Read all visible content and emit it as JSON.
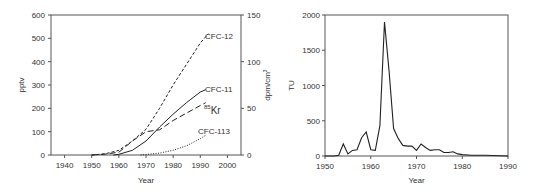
{
  "chart_data": [
    {
      "type": "line",
      "title": "",
      "xlabel": "Year",
      "ylabel": "pptv",
      "ylabel_right": "dpm/cm3",
      "xlim": [
        1935,
        2005
      ],
      "ylim": [
        0,
        600
      ],
      "ylim_right": [
        0,
        150
      ],
      "xticks": [
        "1940",
        "1950",
        "1960",
        "1970",
        "1980",
        "1990",
        "2000"
      ],
      "yticks": [
        "0",
        "100",
        "200",
        "300",
        "400",
        "500",
        "600"
      ],
      "yticks_right": [
        "0",
        "50",
        "100",
        "150"
      ],
      "grid": false,
      "series": [
        {
          "name": "CFC-12",
          "style": "dashed",
          "axis": "left",
          "x": [
            1950,
            1955,
            1960,
            1965,
            1970,
            1975,
            1980,
            1985,
            1990,
            1993
          ],
          "y": [
            0,
            5,
            20,
            60,
            110,
            200,
            300,
            390,
            480,
            520
          ]
        },
        {
          "name": "CFC-11",
          "style": "solid",
          "axis": "left",
          "x": [
            1958,
            1960,
            1965,
            1970,
            1975,
            1980,
            1985,
            1990,
            1992
          ],
          "y": [
            0,
            3,
            20,
            60,
            120,
            175,
            225,
            270,
            280
          ]
        },
        {
          "name": "85Kr",
          "style": "long-dashed",
          "axis": "right",
          "x": [
            1950,
            1955,
            1960,
            1965,
            1970,
            1975,
            1980,
            1985,
            1990,
            1992
          ],
          "y": [
            0,
            1,
            3,
            15,
            25,
            27,
            37,
            45,
            53,
            56
          ]
        },
        {
          "name": "CFC-113",
          "style": "dotted",
          "axis": "left",
          "x": [
            1968,
            1970,
            1975,
            1980,
            1985,
            1990,
            1992
          ],
          "y": [
            0,
            2,
            8,
            20,
            40,
            70,
            85
          ]
        }
      ],
      "annotations": [
        "CFC-12",
        "CFC-11",
        "85Kr",
        "CFC-113"
      ]
    },
    {
      "type": "line",
      "title": "",
      "xlabel": "Year",
      "ylabel": "TU",
      "xlim": [
        1950,
        1990
      ],
      "ylim": [
        0,
        2000
      ],
      "xticks": [
        "1950",
        "1960",
        "1970",
        "1980",
        "1990"
      ],
      "yticks": [
        "0",
        "500",
        "1000",
        "1500",
        "2000"
      ],
      "grid": false,
      "series": [
        {
          "name": "Tritium",
          "x": [
            1950,
            1952,
            1953,
            1954,
            1955,
            1956,
            1957,
            1958,
            1959,
            1960,
            1961,
            1962,
            1963,
            1964,
            1965,
            1966,
            1967,
            1968,
            1969,
            1970,
            1971,
            1972,
            1973,
            1974,
            1975,
            1976,
            1977,
            1978,
            1979,
            1980,
            1982,
            1985,
            1990
          ],
          "y": [
            0,
            0,
            10,
            170,
            30,
            80,
            90,
            260,
            340,
            90,
            80,
            430,
            1900,
            1200,
            390,
            250,
            150,
            140,
            140,
            80,
            170,
            120,
            80,
            90,
            90,
            50,
            50,
            60,
            30,
            20,
            10,
            10,
            0
          ]
        }
      ]
    }
  ]
}
